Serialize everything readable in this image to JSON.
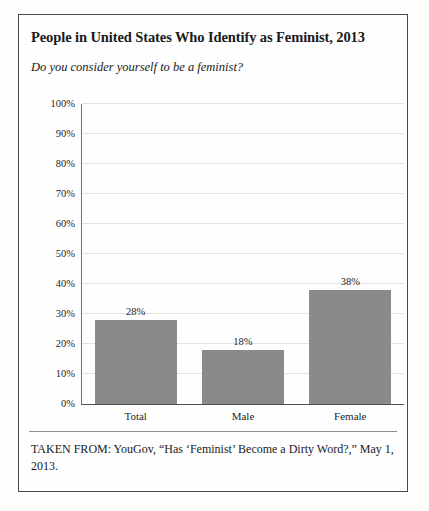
{
  "figure": {
    "title": "People in United States Who Identify as Feminist, 2013",
    "subtitle": "Do you consider yourself to be a feminist?",
    "caption": "TAKEN FROM: YouGov, “Has ‘Feminist’ Become a Dirty Word?,” May 1, 2013."
  },
  "colors": {
    "bar_fill": "#8a8a8a",
    "gridline": "#e2e2e2",
    "axis": "#4d4d4d",
    "frame": "#4a4a4a",
    "text": "#1a1a1a"
  },
  "chart_data": {
    "type": "bar",
    "title": "People in United States Who Identify as Feminist, 2013",
    "subtitle": "Do you consider yourself to be a feminist?",
    "categories": [
      "Total",
      "Male",
      "Female"
    ],
    "values": [
      28,
      18,
      38
    ],
    "value_labels": [
      "28%",
      "18%",
      "38%"
    ],
    "xlabel": "",
    "ylabel": "",
    "ylim": [
      0,
      100
    ],
    "ytick_values": [
      100,
      90,
      80,
      70,
      60,
      50,
      40,
      30,
      20,
      10,
      0
    ],
    "ytick_labels": [
      "100%",
      "90%",
      "80%",
      "70%",
      "60%",
      "50%",
      "40%",
      "30%",
      "20%",
      "10%",
      "0%"
    ],
    "grid": true,
    "legend": false,
    "units": "percent"
  }
}
